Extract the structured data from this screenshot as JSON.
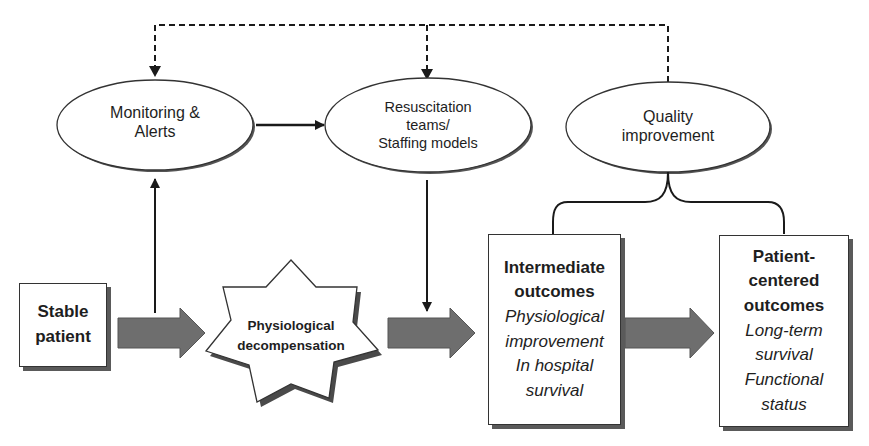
{
  "diagram": {
    "title": "",
    "nodes": {
      "monitoring": {
        "label_line1": "Monitoring &",
        "label_line2": "Alerts",
        "shape": "ellipse"
      },
      "resuscitation": {
        "label_line1": "Resuscitation",
        "label_line2": "teams/",
        "label_line3": "Staffing models",
        "shape": "ellipse"
      },
      "quality": {
        "label_line1": "Quality",
        "label_line2": "improvement",
        "shape": "ellipse"
      },
      "stable_patient": {
        "label_line1": "Stable",
        "label_line2": "patient",
        "shape": "box"
      },
      "decompensation": {
        "label_line1": "Physiological",
        "label_line2": "decompensation",
        "shape": "star"
      },
      "intermediate": {
        "title_line1": "Intermediate",
        "title_line2": "outcomes",
        "items": [
          "Physiological",
          "improvement",
          "In hospital",
          "survival"
        ],
        "shape": "box"
      },
      "patient_centered": {
        "title_line1": "Patient-",
        "title_line2": "centered",
        "title_line3": "outcomes",
        "items": [
          "Long-term",
          "survival",
          "Functional",
          "status"
        ],
        "shape": "box"
      }
    },
    "edges": [
      {
        "from": "quality",
        "to": "monitoring",
        "style": "dashed"
      },
      {
        "from": "quality",
        "to": "resuscitation",
        "style": "dashed"
      },
      {
        "from": "monitoring",
        "to": "resuscitation",
        "style": "solid"
      },
      {
        "from": "stable_patient",
        "to": "monitoring",
        "style": "solid"
      },
      {
        "from": "resuscitation",
        "to": "intermediate",
        "style": "solid"
      },
      {
        "from": "stable_patient",
        "to": "decompensation",
        "style": "block-arrow"
      },
      {
        "from": "decompensation",
        "to": "intermediate",
        "style": "block-arrow"
      },
      {
        "from": "intermediate",
        "to": "patient_centered",
        "style": "block-arrow"
      },
      {
        "from": "quality",
        "to": [
          "intermediate",
          "patient_centered"
        ],
        "style": "brace"
      }
    ],
    "colors": {
      "line": "#1a1a1a",
      "block_arrow": "#6e6e6e",
      "shadow": "#5a5a5a",
      "background": "#ffffff"
    }
  }
}
